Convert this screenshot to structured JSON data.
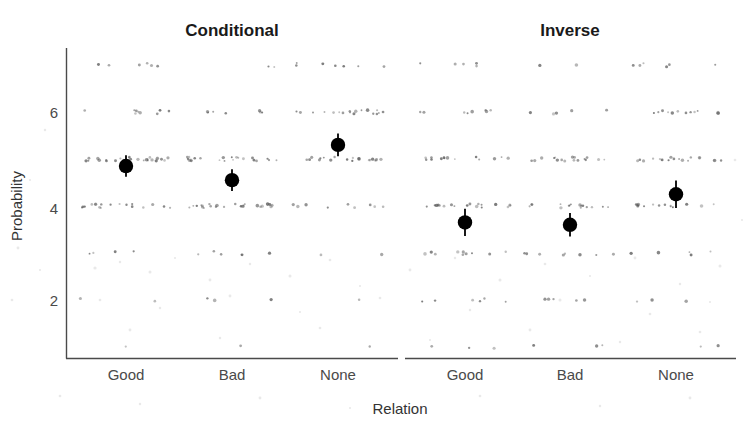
{
  "figure": {
    "background_color": "#ffffff",
    "point_color": "#000000",
    "jitter_color": "#5a5a5a",
    "axis_color": "#4a4a4a"
  },
  "axes": {
    "y_title": "Probability",
    "x_title": "Relation",
    "y_ticks": [
      "6",
      "4",
      "2"
    ],
    "x_ticks": [
      "Good",
      "Bad",
      "None"
    ]
  },
  "facets": [
    {
      "label": "Conditional"
    },
    {
      "label": "Inverse"
    }
  ],
  "chart_data": {
    "type": "scatter",
    "title": "",
    "subtitle": "",
    "xlabel": "Relation",
    "ylabel": "Probability",
    "ylim": [
      0.6,
      7.4
    ],
    "y_ticks": [
      2,
      4,
      6
    ],
    "grid": false,
    "legend": "none",
    "facet_variable": "Direction",
    "facets": [
      "Conditional",
      "Inverse"
    ],
    "categories": [
      "Good",
      "Bad",
      "None"
    ],
    "annotations": [],
    "series": [
      {
        "name": "Conditional",
        "categories": [
          "Good",
          "Bad",
          "None"
        ],
        "values": [
          4.85,
          4.55,
          5.3
        ],
        "ci_low": [
          4.62,
          4.32,
          5.06
        ],
        "ci_high": [
          5.08,
          4.78,
          5.54
        ]
      },
      {
        "name": "Inverse",
        "categories": [
          "Good",
          "Bad",
          "None"
        ],
        "values": [
          3.65,
          3.6,
          4.25
        ],
        "ci_low": [
          3.36,
          3.35,
          3.96
        ],
        "ci_high": [
          3.94,
          3.85,
          4.54
        ]
      }
    ],
    "raw_points_note": "Jittered individual responses on a 1-7 integer scale shown as light grey bands behind each mean",
    "raw_levels": [
      1,
      2,
      3,
      4,
      5,
      6,
      7
    ],
    "raw_counts": {
      "Conditional.Good": {
        "7": 6,
        "6": 9,
        "5": 26,
        "4": 18,
        "3": 4,
        "2": 2,
        "1": 1
      },
      "Conditional.Bad": {
        "7": 2,
        "6": 7,
        "5": 22,
        "4": 24,
        "3": 6,
        "2": 3,
        "1": 1
      },
      "Conditional.None": {
        "7": 7,
        "6": 18,
        "5": 20,
        "4": 9,
        "3": 2,
        "2": 1,
        "1": 1
      },
      "Inverse.Good": {
        "7": 5,
        "6": 8,
        "5": 14,
        "4": 18,
        "3": 10,
        "2": 6,
        "1": 3
      },
      "Inverse.Bad": {
        "7": 2,
        "6": 5,
        "5": 17,
        "4": 16,
        "3": 8,
        "2": 5,
        "1": 3
      },
      "Inverse.None": {
        "7": 6,
        "6": 12,
        "5": 18,
        "4": 14,
        "3": 5,
        "2": 3,
        "1": 2
      }
    }
  }
}
